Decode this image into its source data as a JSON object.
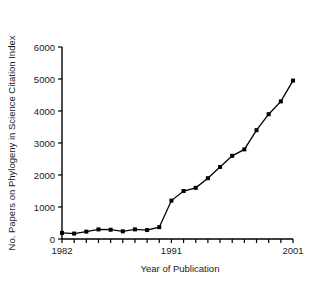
{
  "chart_data": {
    "type": "line",
    "title": "",
    "xlabel": "Year of Publication",
    "ylabel": "No. Papers on Phylogeny in Science Citation Index",
    "x": [
      1982,
      1983,
      1984,
      1985,
      1986,
      1987,
      1988,
      1989,
      1990,
      1991,
      1992,
      1993,
      1994,
      1995,
      1996,
      1997,
      1998,
      1999,
      2000,
      2001
    ],
    "values": [
      190,
      170,
      230,
      300,
      290,
      240,
      300,
      280,
      370,
      1200,
      1500,
      1600,
      1900,
      2250,
      2600,
      2800,
      3400,
      3900,
      4300,
      4950
    ],
    "xlim": [
      1982,
      2001
    ],
    "ylim": [
      0,
      6000
    ],
    "ytick_values": [
      0,
      1000,
      2000,
      3000,
      4000,
      5000,
      6000
    ],
    "ytick_labels": [
      "0",
      "1000",
      "2000",
      "3000",
      "4000",
      "5000",
      "6000"
    ],
    "xtick_values": [
      1982,
      1983,
      1984,
      1985,
      1986,
      1987,
      1988,
      1989,
      1990,
      1991,
      1992,
      1993,
      1994,
      1995,
      1996,
      1997,
      1998,
      1999,
      2000,
      2001
    ],
    "xtick_labeled": [
      1982,
      1991,
      2001
    ],
    "xtick_labels": [
      "1982",
      "1991",
      "2001"
    ],
    "grid": false,
    "legend": false,
    "marker": "filled-square",
    "line_color": "#000000",
    "marker_color": "#000000",
    "axis_color": "#000000",
    "background_color": "#ffffff"
  }
}
